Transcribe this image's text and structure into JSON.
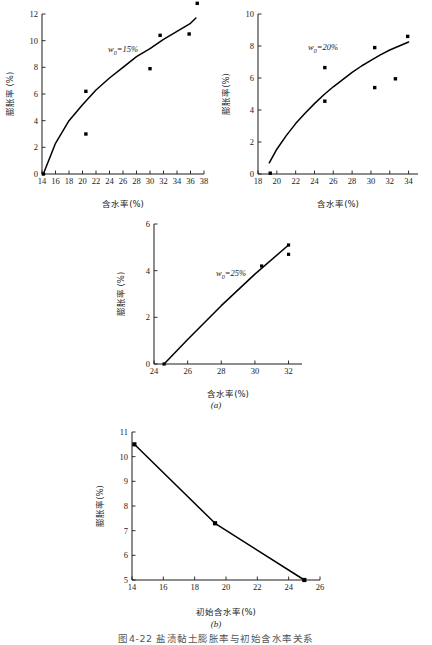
{
  "figure": {
    "caption": "图4-22  盐渍黏土膨胀率与初始含水率关系",
    "sublabel_a": "(a)",
    "sublabel_b": "(b)"
  },
  "chart_data": [
    {
      "id": "a1",
      "type": "scatter",
      "title": "",
      "annotation": "w",
      "annotation_sub": "0",
      "annotation_rest": "=15%",
      "xlabel": "含水率(%)",
      "ylabel": "膨胀率 (%)",
      "xlim": [
        14,
        38
      ],
      "ylim": [
        0,
        12
      ],
      "xticks": [
        "14",
        "16",
        "18",
        "20",
        "22",
        "24",
        "26",
        "28",
        "30",
        "32",
        "34",
        "36",
        "38"
      ],
      "yticks": [
        "0",
        "2",
        "4",
        "6",
        "8",
        "10",
        "12"
      ],
      "grid": false,
      "points": [
        {
          "x": 14.2,
          "y": 0.0
        },
        {
          "x": 20.5,
          "y": 6.2
        },
        {
          "x": 20.5,
          "y": 3.0
        },
        {
          "x": 30.0,
          "y": 7.9
        },
        {
          "x": 31.5,
          "y": 10.4
        },
        {
          "x": 35.8,
          "y": 10.5
        },
        {
          "x": 37.0,
          "y": 12.8
        }
      ],
      "fit_curve": [
        {
          "x": 14.2,
          "y": 0.0
        },
        {
          "x": 16.0,
          "y": 2.3
        },
        {
          "x": 18.0,
          "y": 4.0
        },
        {
          "x": 20.0,
          "y": 5.2
        },
        {
          "x": 22.0,
          "y": 6.3
        },
        {
          "x": 24.0,
          "y": 7.2
        },
        {
          "x": 26.0,
          "y": 8.0
        },
        {
          "x": 28.0,
          "y": 8.8
        },
        {
          "x": 30.0,
          "y": 9.4
        },
        {
          "x": 32.0,
          "y": 10.1
        },
        {
          "x": 34.0,
          "y": 10.7
        },
        {
          "x": 36.0,
          "y": 11.3
        },
        {
          "x": 36.8,
          "y": 11.7
        }
      ]
    },
    {
      "id": "a2",
      "type": "scatter",
      "title": "",
      "annotation": "w",
      "annotation_sub": "0",
      "annotation_rest": "=20%",
      "xlabel": "含水率(%)",
      "ylabel": "膨胀率(%)",
      "xlim": [
        18,
        35
      ],
      "ylim": [
        0,
        10
      ],
      "xticks": [
        "18",
        "20",
        "22",
        "24",
        "26",
        "28",
        "30",
        "32",
        "34"
      ],
      "yticks": [
        "0",
        "2",
        "4",
        "6",
        "8",
        "10"
      ],
      "grid": false,
      "points": [
        {
          "x": 19.3,
          "y": 0.05
        },
        {
          "x": 25.1,
          "y": 6.65
        },
        {
          "x": 25.1,
          "y": 4.55
        },
        {
          "x": 30.4,
          "y": 7.9
        },
        {
          "x": 30.4,
          "y": 5.4
        },
        {
          "x": 32.6,
          "y": 5.95
        },
        {
          "x": 33.9,
          "y": 8.6
        }
      ],
      "fit_curve": [
        {
          "x": 19.2,
          "y": 0.7
        },
        {
          "x": 20.0,
          "y": 1.55
        },
        {
          "x": 21.0,
          "y": 2.4
        },
        {
          "x": 22.0,
          "y": 3.15
        },
        {
          "x": 23.0,
          "y": 3.8
        },
        {
          "x": 24.0,
          "y": 4.4
        },
        {
          "x": 25.0,
          "y": 4.95
        },
        {
          "x": 26.0,
          "y": 5.45
        },
        {
          "x": 27.0,
          "y": 5.9
        },
        {
          "x": 28.0,
          "y": 6.35
        },
        {
          "x": 29.0,
          "y": 6.75
        },
        {
          "x": 30.0,
          "y": 7.1
        },
        {
          "x": 31.0,
          "y": 7.45
        },
        {
          "x": 32.0,
          "y": 7.75
        },
        {
          "x": 33.0,
          "y": 8.0
        },
        {
          "x": 34.0,
          "y": 8.25
        }
      ]
    },
    {
      "id": "a3",
      "type": "scatter",
      "title": "",
      "annotation": "w",
      "annotation_sub": "0",
      "annotation_rest": "=25%",
      "xlabel": "含水率(%)",
      "ylabel": "膨胀率 (%)",
      "xlim": [
        24,
        32.8
      ],
      "ylim": [
        0,
        6
      ],
      "xticks": [
        "24",
        "26",
        "28",
        "30",
        "32"
      ],
      "yticks": [
        "0",
        "2",
        "4",
        "6"
      ],
      "grid": false,
      "points": [
        {
          "x": 24.6,
          "y": 0.0
        },
        {
          "x": 30.4,
          "y": 4.2
        },
        {
          "x": 32.0,
          "y": 5.1
        },
        {
          "x": 32.0,
          "y": 4.7
        }
      ],
      "fit_curve": [
        {
          "x": 24.6,
          "y": 0.0
        },
        {
          "x": 26.0,
          "y": 1.05
        },
        {
          "x": 28.0,
          "y": 2.5
        },
        {
          "x": 30.0,
          "y": 3.85
        },
        {
          "x": 32.0,
          "y": 5.1
        }
      ]
    },
    {
      "id": "b",
      "type": "line",
      "title": "",
      "xlabel": "初始含水率(%)",
      "ylabel": "膨胀率(%)",
      "xlim": [
        14,
        26
      ],
      "ylim": [
        5,
        11
      ],
      "xticks": [
        "14",
        "16",
        "18",
        "20",
        "22",
        "24",
        "26"
      ],
      "yticks": [
        "5",
        "6",
        "7",
        "8",
        "9",
        "10",
        "11"
      ],
      "grid": false,
      "points": [
        {
          "x": 14.15,
          "y": 10.5
        },
        {
          "x": 19.3,
          "y": 7.3
        },
        {
          "x": 25.0,
          "y": 5.0
        }
      ]
    }
  ]
}
